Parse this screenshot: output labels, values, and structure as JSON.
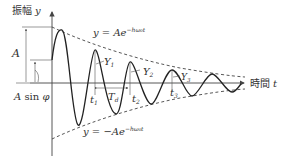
{
  "axes": {
    "y_label_jp": "振幅",
    "y_label_var": "y",
    "x_label_jp": "時間",
    "x_label_var": "t"
  },
  "envelope": {
    "upper_label_lhs": "y = Ae",
    "upper_label_exp": "−hω₀t",
    "lower_label_lhs": "y = −Ae",
    "lower_label_exp": "−hω₀t"
  },
  "annotations": {
    "amplitude": "A",
    "initial_offset": "A sin φ",
    "period": "T_d",
    "period_main": "T",
    "period_sub": "d"
  },
  "peaks": [
    {
      "label": "Y",
      "sub": "1"
    },
    {
      "label": "Y",
      "sub": "2"
    },
    {
      "label": "Y",
      "sub": "3"
    }
  ],
  "times": [
    {
      "label": "t",
      "sub": "1"
    },
    {
      "label": "t",
      "sub": "2"
    },
    {
      "label": "t",
      "sub": "3"
    }
  ],
  "colors": {
    "curve": "#222222",
    "axis": "#444444",
    "text": "#333333",
    "background": "#ffffff"
  }
}
